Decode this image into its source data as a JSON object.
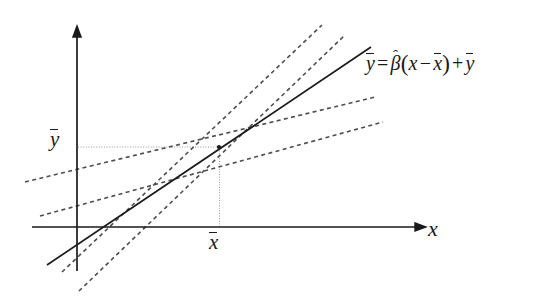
{
  "figure": {
    "background_color": "#ffffff",
    "stroke_color": "#1a1a1a",
    "guide_color": "#9a9a9a",
    "dashed_color": "#4d4d4d"
  },
  "labels": {
    "y_mean": "y",
    "x_mean": "x",
    "x_axis": "x"
  },
  "equation": {
    "lhs": "y",
    "equals": "=",
    "beta": "β",
    "hat": "ˆ",
    "open_paren": "(",
    "x": "x",
    "minus": "−",
    "x_mean": "x",
    "close_paren": ")",
    "plus": "+",
    "y_mean": "y",
    "full_text": "ȳ = β̂(x − x̄) + ȳ"
  },
  "chart_data": {
    "type": "line",
    "title": "",
    "xlabel": "x",
    "ylabel": "",
    "grid": false,
    "legend": "none",
    "axes": {
      "x_axis": {
        "x1": 32,
        "y1": 227,
        "x2": 424,
        "y2": 227,
        "arrow": "right"
      },
      "y_axis": {
        "x1": 77,
        "y1": 28,
        "x2": 77,
        "y2": 271,
        "arrow": "up"
      }
    },
    "annotations": {
      "mean_point": {
        "x": 219,
        "y": 147,
        "label": "(x̄, ȳ)"
      },
      "guide_horizontal": {
        "x1": 78,
        "y1": 147,
        "x2": 219,
        "y2": 147,
        "style": "dotted"
      },
      "guide_vertical": {
        "x1": 219,
        "y1": 148,
        "x2": 219,
        "y2": 227,
        "style": "dotted"
      },
      "equation_text": "ȳ = β̂(x − x̄) + ȳ"
    },
    "series": [
      {
        "name": "fitted-regression-line",
        "style": "solid",
        "slope_label": "beta-hat",
        "points": [
          [
            47,
            265
          ],
          [
            219,
            147
          ],
          [
            371,
            47
          ]
        ]
      },
      {
        "name": "candidate-line-steep-1",
        "style": "dashed",
        "points": [
          [
            62,
            272
          ],
          [
            219,
            147
          ],
          [
            322,
            25
          ]
        ]
      },
      {
        "name": "candidate-line-steep-2",
        "style": "dashed",
        "points": [
          [
            79,
            291
          ],
          [
            219,
            147
          ],
          [
            345,
            35
          ]
        ]
      },
      {
        "name": "candidate-line-shallow-1",
        "style": "dashed",
        "points": [
          [
            25,
            182
          ],
          [
            219,
            147
          ],
          [
            375,
            97
          ]
        ]
      },
      {
        "name": "candidate-line-shallow-2",
        "style": "dashed",
        "points": [
          [
            40,
            216
          ],
          [
            219,
            147
          ],
          [
            383,
            122
          ]
        ]
      }
    ]
  }
}
